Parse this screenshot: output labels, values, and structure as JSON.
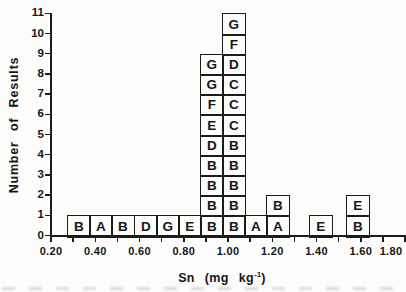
{
  "chart_data": {
    "type": "bar",
    "subtype": "stacked-letter-histogram",
    "ylabel": "Number of Results",
    "xlabel": {
      "pre": "Sn (mg kg",
      "sup": "-1",
      "post": ")",
      "plain": "Sn (mg kg⁻¹)"
    },
    "xlim": [
      0.2,
      1.8
    ],
    "ylim": [
      0,
      11
    ],
    "grid": false,
    "legend": "none",
    "x_ticks": [
      0.2,
      0.3,
      0.4,
      0.5,
      0.6,
      0.7,
      0.8,
      0.9,
      1.0,
      1.1,
      1.2,
      1.3,
      1.4,
      1.5,
      1.6,
      1.7,
      1.8
    ],
    "x_tick_labels": [
      {
        "v": 0.2,
        "t": "0.20"
      },
      {
        "v": 0.4,
        "t": "0.40"
      },
      {
        "v": 0.6,
        "t": "0.60"
      },
      {
        "v": 0.8,
        "t": "0.80"
      },
      {
        "v": 1.0,
        "t": "1.00"
      },
      {
        "v": 1.2,
        "t": "1.20"
      },
      {
        "v": 1.4,
        "t": "1.40"
      },
      {
        "v": 1.6,
        "t": "1.60"
      },
      {
        "v": 1.8,
        "t": "1.80"
      }
    ],
    "y_ticks": [
      {
        "v": 0,
        "t": "0"
      },
      {
        "v": 1,
        "t": "1"
      },
      {
        "v": 2,
        "t": "2"
      },
      {
        "v": 3,
        "t": "3"
      },
      {
        "v": 4,
        "t": "4"
      },
      {
        "v": 5,
        "t": "5"
      },
      {
        "v": 6,
        "t": "6"
      },
      {
        "v": 7,
        "t": "7"
      },
      {
        "v": 8,
        "t": "8"
      },
      {
        "v": 9,
        "t": "9"
      },
      {
        "v": 10,
        "t": "10"
      },
      {
        "v": 11,
        "t": "11"
      }
    ],
    "bin_width": 0.1,
    "columns": [
      {
        "x": 0.3,
        "count": 1,
        "stack": [
          "B"
        ]
      },
      {
        "x": 0.4,
        "count": 1,
        "stack": [
          "A"
        ]
      },
      {
        "x": 0.5,
        "count": 1,
        "stack": [
          "B"
        ]
      },
      {
        "x": 0.6,
        "count": 1,
        "stack": [
          "D"
        ]
      },
      {
        "x": 0.7,
        "count": 1,
        "stack": [
          "G"
        ]
      },
      {
        "x": 0.8,
        "count": 1,
        "stack": [
          "E"
        ]
      },
      {
        "x": 0.9,
        "count": 9,
        "stack": [
          "B",
          "B",
          "B",
          "B",
          "D",
          "E",
          "F",
          "G",
          "G"
        ]
      },
      {
        "x": 1.0,
        "count": 11,
        "stack": [
          "B",
          "B",
          "B",
          "B",
          "B",
          "C",
          "C",
          "C",
          "D",
          "F",
          "G"
        ]
      },
      {
        "x": 1.1,
        "count": 1,
        "stack": [
          "A"
        ]
      },
      {
        "x": 1.2,
        "count": 2,
        "stack": [
          "A",
          "B"
        ]
      },
      {
        "x": 1.4,
        "count": 1,
        "stack": [
          "E"
        ]
      },
      {
        "x": 1.6,
        "count": 2,
        "stack": [
          "B",
          "E"
        ]
      }
    ],
    "colors": {
      "line": "#1b1b1b",
      "background": "#fcfcfb",
      "text": "#161616"
    }
  }
}
